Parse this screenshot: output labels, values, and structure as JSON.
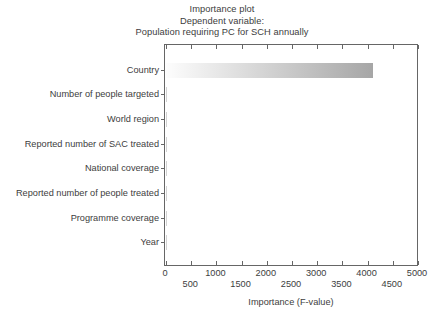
{
  "chart_data": {
    "type": "bar",
    "orientation": "horizontal",
    "title": "Importance plot",
    "title_lines": [
      "Importance plot",
      "Dependent variable:",
      "Population requiring PC for SCH annually"
    ],
    "xlabel": "Importance (F-value)",
    "ylabel": "",
    "categories": [
      "Country",
      "Number of people targeted",
      "World region",
      "Reported number of SAC treated",
      "National coverage",
      "Reported number of people treated",
      "Programme coverage",
      "Year"
    ],
    "values": [
      4115,
      12,
      8,
      6,
      5,
      4,
      3,
      2
    ],
    "xlim": [
      0,
      5000
    ],
    "xticks": [
      0,
      500,
      1000,
      1500,
      2000,
      2500,
      3000,
      3500,
      4000,
      4500,
      5000
    ],
    "xtick_labels_row1": [
      "0",
      "1000",
      "2000",
      "3000",
      "4000",
      "5000"
    ],
    "xtick_labels_row2": [
      "500",
      "1500",
      "2500",
      "3500",
      "4500"
    ],
    "grid": false,
    "legend": null,
    "bar_gradient_from": "#fdfdfd",
    "bar_gradient_to": "#a6a6a6",
    "axis_color": "#666666",
    "text_color": "#3d3d3d",
    "background": "#ffffff"
  }
}
